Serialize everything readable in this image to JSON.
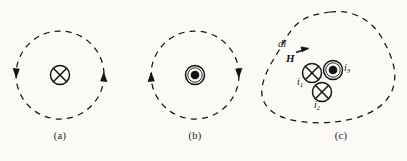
{
  "figure": {
    "background_color": "#fbfaf7",
    "ink_color": "#141414",
    "width": 407,
    "height": 161,
    "panels": [
      {
        "id": "a",
        "caption": "(a)",
        "path_shape": "circle",
        "path_style": "dashed",
        "circulation": "clockwise",
        "center_symbol": "cross-in-circle",
        "center_symbol_meaning": "current into page"
      },
      {
        "id": "b",
        "caption": "(b)",
        "path_shape": "circle",
        "path_style": "dashed",
        "circulation": "counterclockwise",
        "center_symbol": "dot-in-circle",
        "center_symbol_meaning": "current out of page"
      },
      {
        "id": "c",
        "caption": "(c)",
        "path_shape": "irregular closed loop",
        "path_style": "dashed",
        "circulation": "counterclockwise",
        "labels": {
          "dl": "dl",
          "h": "H",
          "i1": "i",
          "i1_sub": "1",
          "i2": "i",
          "i2_sub": "2",
          "i3": "i",
          "i3_sub": "3"
        },
        "currents": [
          {
            "label": "i1",
            "symbol": "cross-in-circle",
            "meaning": "into page"
          },
          {
            "label": "i2",
            "symbol": "cross-in-circle",
            "meaning": "into page"
          },
          {
            "label": "i3",
            "symbol": "dot-in-circle",
            "meaning": "out of page"
          }
        ]
      }
    ]
  },
  "captions": {
    "a": "(a)",
    "b": "(b)",
    "c": "(c)"
  }
}
